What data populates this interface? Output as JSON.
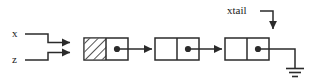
{
  "diagram": {
    "type": "linked-list-pointer-diagram",
    "stroke_color": "#2b2b2b",
    "text_color": "#1a1a1a",
    "background_color": "#ffffff",
    "labels": {
      "x": "x",
      "z": "z",
      "xtail": "xtail"
    },
    "pointers": [
      {
        "name": "x",
        "label": "x",
        "target": "node-1",
        "style": "step-down"
      },
      {
        "name": "z",
        "label": "z",
        "target": "node-1",
        "style": "step-up"
      },
      {
        "name": "xtail",
        "label": "xtail",
        "target": "node-3",
        "style": "elbow-down"
      }
    ],
    "nodes": [
      {
        "id": "node-1",
        "data_cell": "hatched",
        "data_value": "",
        "next_cell": "pointer-dot",
        "next_target": "node-2"
      },
      {
        "id": "node-2",
        "data_cell": "empty",
        "data_value": "",
        "next_cell": "pointer-dot",
        "next_target": "node-3"
      },
      {
        "id": "node-3",
        "data_cell": "empty",
        "data_value": "",
        "next_cell": "pointer-dot",
        "next_target": "ground"
      }
    ],
    "terminator": {
      "id": "ground",
      "symbol": "ground",
      "meaning": "null"
    }
  }
}
